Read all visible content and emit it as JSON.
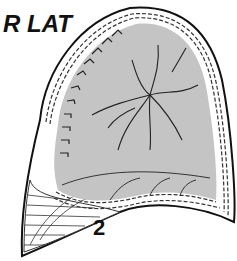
{
  "diagram": {
    "view_label": "R LAT",
    "region_label": "2",
    "colors": {
      "lung_fill": "#c4c4c4",
      "outline": "#111111",
      "background": "#ffffff"
    }
  }
}
